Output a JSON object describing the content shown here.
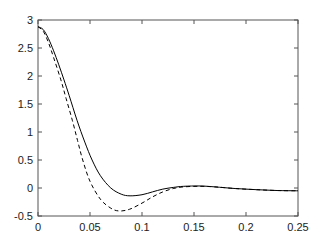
{
  "chart_data": {
    "type": "line",
    "title": "",
    "xlabel": "",
    "ylabel": "",
    "xlim": [
      0,
      0.25
    ],
    "ylim": [
      -0.5,
      3
    ],
    "grid": false,
    "legend": null,
    "xticks": [
      0,
      0.05,
      0.1,
      0.15,
      0.2,
      0.25
    ],
    "xtick_labels": [
      "0",
      "0.05",
      "0.1",
      "0.15",
      "0.2",
      "0.25"
    ],
    "yticks": [
      -0.5,
      0,
      0.5,
      1,
      1.5,
      2,
      2.5,
      3
    ],
    "ytick_labels": [
      "-0.5",
      "0",
      "0.5",
      "1",
      "1.5",
      "2",
      "2.5",
      "3"
    ],
    "series": [
      {
        "name": "solid",
        "style": "solid",
        "color": "#000000",
        "x": [
          0,
          0.005,
          0.01,
          0.015,
          0.02,
          0.025,
          0.03,
          0.0375,
          0.045,
          0.052,
          0.06,
          0.07,
          0.08,
          0.0885,
          0.1,
          0.11,
          0.12,
          0.13,
          0.14,
          0.156,
          0.17,
          0.19,
          0.21,
          0.23,
          0.25
        ],
        "y": [
          2.88,
          2.83,
          2.67,
          2.45,
          2.2,
          1.93,
          1.65,
          1.21,
          0.82,
          0.5,
          0.22,
          0.0,
          -0.11,
          -0.14,
          -0.12,
          -0.07,
          -0.02,
          0.01,
          0.03,
          0.036,
          0.02,
          -0.01,
          -0.03,
          -0.045,
          -0.05
        ]
      },
      {
        "name": "dashed",
        "style": "dashed",
        "color": "#000000",
        "x": [
          0,
          0.005,
          0.01,
          0.015,
          0.022,
          0.027,
          0.033,
          0.038,
          0.043,
          0.05,
          0.06,
          0.07,
          0.078,
          0.088,
          0.1,
          0.11,
          0.12,
          0.13,
          0.14,
          0.156,
          0.17,
          0.19,
          0.21,
          0.23,
          0.25
        ],
        "y": [
          2.88,
          2.8,
          2.6,
          2.33,
          1.93,
          1.6,
          1.21,
          0.85,
          0.5,
          0.12,
          -0.2,
          -0.36,
          -0.41,
          -0.38,
          -0.27,
          -0.16,
          -0.07,
          -0.01,
          0.02,
          0.03,
          0.02,
          -0.01,
          -0.03,
          -0.045,
          -0.05
        ]
      }
    ]
  }
}
